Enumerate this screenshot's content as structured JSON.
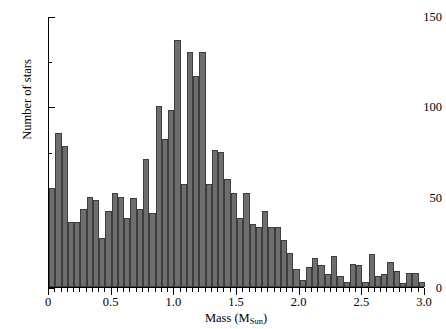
{
  "chart_data": {
    "type": "bar",
    "title": "",
    "subtitle": "",
    "xlabel": "Mass (M_Sun)",
    "xlabel_main": "Mass (M",
    "xlabel_sub": "Sun",
    "xlabel_tail": ")",
    "ylabel": "Number of stars",
    "xlim": [
      0.0,
      3.0
    ],
    "ylim": [
      0,
      150
    ],
    "bin_width": 0.05,
    "grid": false,
    "legend": null,
    "bar_color": "#6e6e6e",
    "bar_edge_color": "#3d3d3d",
    "axis_color": "#000000",
    "background": "#ffffff",
    "x_major_ticks": [
      0.0,
      0.5,
      1.0,
      1.5,
      2.0,
      2.5,
      3.0
    ],
    "x_major_tick_labels": [
      "0",
      "0.5",
      "1.0",
      "1.5",
      "2.0",
      "2.5",
      "3.0"
    ],
    "x_minor_tick_step": 0.05,
    "y_major_ticks": [
      0,
      50,
      100,
      150
    ],
    "y_major_tick_labels": [
      "0",
      "50",
      "100",
      "150"
    ],
    "y_minor_ticks": [
      25,
      75,
      125
    ],
    "bin_left_edges": [
      0.0,
      0.05,
      0.1,
      0.15,
      0.2,
      0.25,
      0.3,
      0.35,
      0.4,
      0.45,
      0.5,
      0.55,
      0.6,
      0.65,
      0.7,
      0.75,
      0.8,
      0.85,
      0.9,
      0.95,
      1.0,
      1.05,
      1.1,
      1.15,
      1.2,
      1.25,
      1.3,
      1.35,
      1.4,
      1.45,
      1.5,
      1.55,
      1.6,
      1.65,
      1.7,
      1.75,
      1.8,
      1.85,
      1.9,
      1.95,
      2.0,
      2.05,
      2.1,
      2.15,
      2.2,
      2.25,
      2.3,
      2.35,
      2.4,
      2.45,
      2.5,
      2.55,
      2.6,
      2.65,
      2.7,
      2.75,
      2.8,
      2.85,
      2.9,
      2.95
    ],
    "bin_centers": [
      0.025,
      0.075,
      0.125,
      0.175,
      0.225,
      0.275,
      0.325,
      0.375,
      0.425,
      0.475,
      0.525,
      0.575,
      0.625,
      0.675,
      0.725,
      0.775,
      0.825,
      0.875,
      0.925,
      0.975,
      1.025,
      1.075,
      1.125,
      1.175,
      1.225,
      1.275,
      1.325,
      1.375,
      1.425,
      1.475,
      1.525,
      1.575,
      1.625,
      1.675,
      1.725,
      1.775,
      1.825,
      1.875,
      1.925,
      1.975,
      2.025,
      2.075,
      2.125,
      2.175,
      2.225,
      2.275,
      2.325,
      2.375,
      2.425,
      2.475,
      2.525,
      2.575,
      2.625,
      2.675,
      2.725,
      2.775,
      2.825,
      2.875,
      2.925,
      2.975
    ],
    "values": [
      55,
      85,
      78,
      36,
      36,
      43,
      50,
      48,
      27,
      42,
      52,
      50,
      38,
      49,
      43,
      71,
      41,
      100,
      82,
      98,
      137,
      57,
      130,
      117,
      130,
      57,
      76,
      75,
      60,
      52,
      38,
      52,
      35,
      33,
      42,
      33,
      33,
      26,
      19,
      10,
      4,
      11,
      16,
      12,
      7,
      17,
      6,
      3,
      13,
      12,
      3,
      18,
      6,
      7,
      14,
      9,
      2,
      8,
      8,
      3
    ],
    "max_value": 137,
    "peak_bin_center": 1.025
  }
}
